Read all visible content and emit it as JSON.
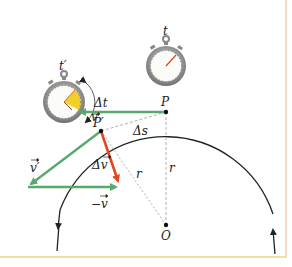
{
  "diagram": {
    "labels": {
      "t_prime": "t′",
      "t": "t",
      "delta_t": "Δt",
      "v": "v",
      "v_prime": "v′",
      "minus_v": "−v",
      "delta_v": "Δv",
      "P": "P",
      "P_prime": "P′",
      "delta_s": "Δs",
      "r_left": "r",
      "r_right": "r",
      "O": "O"
    },
    "colors": {
      "velocity_vectors": "#5aa86c",
      "delta_v_vector": "#e2481e",
      "arc": "#222222",
      "dashed": "#999999",
      "stopwatch_sector": "#f2d02a",
      "frame_border": "#f3dcc4"
    },
    "points": {
      "P": [
        166,
        112
      ],
      "P_prime": [
        101,
        131
      ],
      "O": [
        166,
        225
      ]
    }
  }
}
